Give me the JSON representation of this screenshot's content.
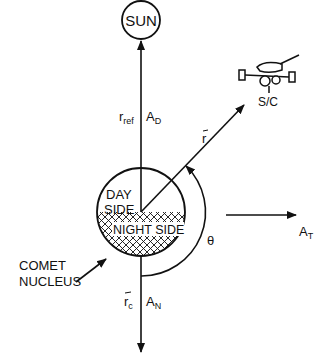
{
  "diagram": {
    "sun_label": "SUN",
    "spacecraft_label": "S/C",
    "nucleus": {
      "day_line1": "DAY",
      "day_line2": "SIDE",
      "night": "NIGHT SIDE",
      "pointer_line1": "COMET",
      "pointer_line2": "NUCLEUS"
    },
    "labels": {
      "r_ref_base": "r",
      "r_ref_sub": "ref",
      "a_d_base": "A",
      "a_d_sub": "D",
      "r_vec": "r",
      "theta": "θ",
      "a_t_base": "A",
      "a_t_sub": "T",
      "r_c_base": "r",
      "r_c_sub": "c",
      "a_n_base": "A",
      "a_n_sub": "N"
    },
    "colors": {
      "line": "#111111",
      "background": "#ffffff"
    }
  }
}
